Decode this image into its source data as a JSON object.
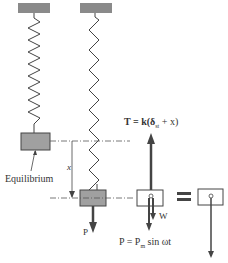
{
  "diagram": {
    "labels": {
      "equilibrium": "Equilibrium",
      "displacement": "x",
      "force_p_left": "P",
      "tension": "T = k(δ",
      "tension_sub": "st",
      "tension_end": " + x)",
      "weight": "W",
      "force_eq": "P = P",
      "force_eq_sub": "m",
      "force_eq_end": " sin ωt",
      "equals": "="
    },
    "colors": {
      "support": "#8a8a8a",
      "mass": "#a0a0a0",
      "line": "#333333",
      "arrow": "#444444"
    }
  }
}
